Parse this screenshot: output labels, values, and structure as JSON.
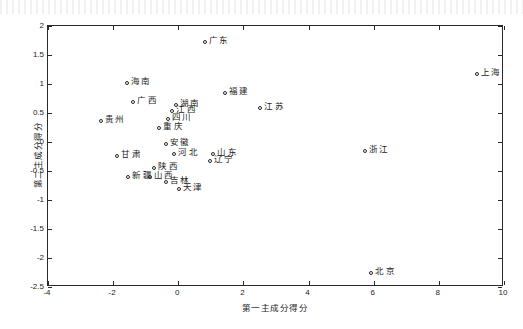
{
  "chart_data": {
    "type": "scatter",
    "title": "",
    "xlabel": "第一主成分得分",
    "ylabel": "第二主成分得分",
    "xlim": [
      -4,
      10
    ],
    "ylim": [
      -2.5,
      2
    ],
    "xticks": [
      "-4",
      "-2",
      "0",
      "2",
      "4",
      "6",
      "8",
      "10"
    ],
    "xtick_values": [
      -4,
      -2,
      0,
      2,
      4,
      6,
      8,
      10
    ],
    "yticks": [
      "2",
      "1.5",
      "1",
      "0.5",
      "0",
      "-0.5",
      "-1",
      "-1.5",
      "-2",
      "-2.5"
    ],
    "ytick_values": [
      2,
      1.5,
      1,
      0.5,
      0,
      -0.5,
      -1,
      -1.5,
      -2,
      -2.5
    ],
    "grid": false,
    "legend": null,
    "marker": "open-circle",
    "marker_color": "#272727",
    "points": [
      {
        "label": "广东",
        "x": 0.85,
        "y": 1.7
      },
      {
        "label": "上海",
        "x": 9.2,
        "y": 1.15
      },
      {
        "label": "海南",
        "x": -1.55,
        "y": 1.0
      },
      {
        "label": "福建",
        "x": 1.45,
        "y": 0.83
      },
      {
        "label": "广西",
        "x": -1.35,
        "y": 0.68
      },
      {
        "label": "湖南",
        "x": -0.05,
        "y": 0.62
      },
      {
        "label": "江苏",
        "x": 2.55,
        "y": 0.57
      },
      {
        "label": "江西",
        "x": -0.15,
        "y": 0.52
      },
      {
        "label": "四川",
        "x": -0.3,
        "y": 0.38
      },
      {
        "label": "贵州",
        "x": -2.35,
        "y": 0.35
      },
      {
        "label": "重庆",
        "x": -0.55,
        "y": 0.22
      },
      {
        "label": "浙江",
        "x": 5.75,
        "y": -0.18
      },
      {
        "label": "安徽",
        "x": -0.35,
        "y": -0.05
      },
      {
        "label": "河北",
        "x": -0.1,
        "y": -0.22
      },
      {
        "label": "山东",
        "x": 1.1,
        "y": -0.22
      },
      {
        "label": "甘肃",
        "x": -1.85,
        "y": -0.25
      },
      {
        "label": "辽宁",
        "x": 1.0,
        "y": -0.35
      },
      {
        "label": "陕西",
        "x": -0.7,
        "y": -0.47
      },
      {
        "label": "新疆",
        "x": -1.5,
        "y": -0.62
      },
      {
        "label": "山西",
        "x": -0.85,
        "y": -0.62
      },
      {
        "label": "吉林",
        "x": -0.35,
        "y": -0.7
      },
      {
        "label": "天津",
        "x": 0.05,
        "y": -0.82
      },
      {
        "label": "北京",
        "x": 5.95,
        "y": -2.28
      }
    ]
  },
  "labels": {
    "x_axis_title": "第一主成分得分",
    "y_axis_title": "第二主成分得分"
  }
}
